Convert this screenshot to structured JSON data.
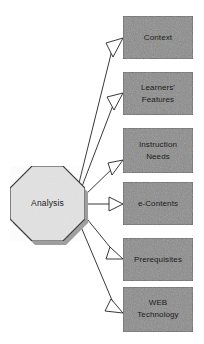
{
  "diagram": {
    "title": "Analysis",
    "canvas": {
      "width": 204,
      "height": 344,
      "background": "#ffffff"
    },
    "source_node": {
      "label": "Analysis",
      "shape": "octagon",
      "fill": "#e2e2e2",
      "stroke": "#2b2b2b",
      "shadow": "#9a9a9a"
    },
    "target_style": {
      "shape": "rectangle",
      "fill": "#8b8b8b",
      "stroke": "#4a4a4a",
      "text_color": "#1b1b1b"
    },
    "connector_style": {
      "type": "open-arrow",
      "stroke": "#222222",
      "arrowhead_fill": "#ffffff"
    },
    "targets": [
      {
        "id": "context",
        "label": "Context",
        "line2": ""
      },
      {
        "id": "learners",
        "label": "Learners'",
        "line2": "Features"
      },
      {
        "id": "instruction",
        "label": "Instruction",
        "line2": "Needs"
      },
      {
        "id": "econtents",
        "label": "e-Contents",
        "line2": ""
      },
      {
        "id": "prerequisites",
        "label": "Prerequisites",
        "line2": ""
      },
      {
        "id": "web",
        "label": "WEB",
        "line2": "Technology"
      }
    ]
  }
}
